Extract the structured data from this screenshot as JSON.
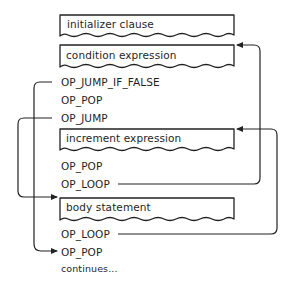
{
  "diagram": {
    "type": "bytecode-control-flow",
    "stroke_color": "#222222",
    "background_color": "#ffffff",
    "nodes": [
      {
        "id": "initializer",
        "kind": "block",
        "label": "initializer clause"
      },
      {
        "id": "condition",
        "kind": "block",
        "label": "condition expression"
      },
      {
        "id": "jump_if_false",
        "kind": "instruction",
        "label": "OP_JUMP_IF_FALSE"
      },
      {
        "id": "pop1",
        "kind": "instruction",
        "label": "OP_POP"
      },
      {
        "id": "jump",
        "kind": "instruction",
        "label": "OP_JUMP"
      },
      {
        "id": "increment",
        "kind": "block",
        "label": "increment expression"
      },
      {
        "id": "pop2",
        "kind": "instruction",
        "label": "OP_POP"
      },
      {
        "id": "loop1",
        "kind": "instruction",
        "label": "OP_LOOP"
      },
      {
        "id": "body",
        "kind": "block",
        "label": "body statement"
      },
      {
        "id": "loop2",
        "kind": "instruction",
        "label": "OP_LOOP"
      },
      {
        "id": "pop3",
        "kind": "instruction",
        "label": "OP_POP"
      },
      {
        "id": "continues",
        "kind": "text",
        "label": "continues..."
      }
    ],
    "edges": [
      {
        "from": "jump_if_false",
        "to": "pop3",
        "side": "left"
      },
      {
        "from": "jump",
        "to": "body",
        "side": "left"
      },
      {
        "from": "loop1",
        "to": "condition",
        "side": "right"
      },
      {
        "from": "loop2",
        "to": "increment",
        "side": "right"
      }
    ]
  }
}
